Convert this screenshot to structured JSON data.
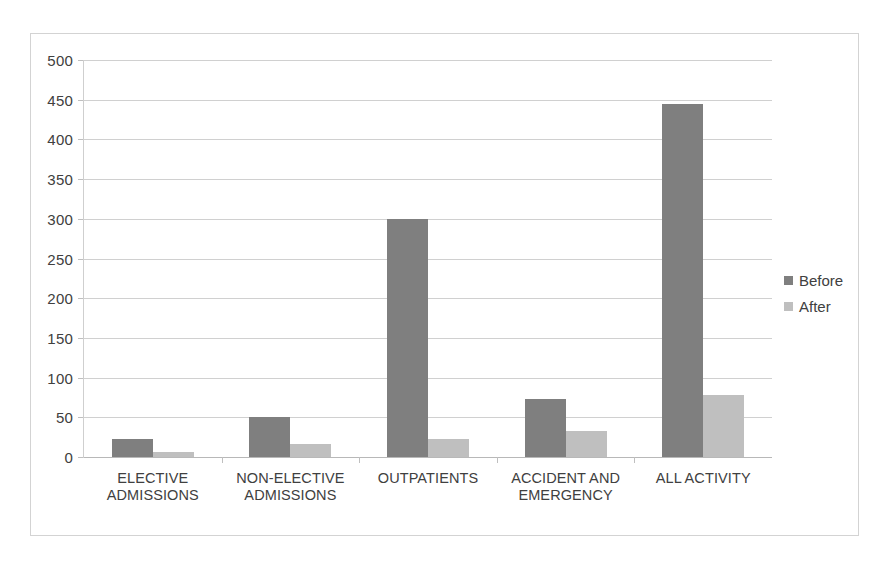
{
  "chart_data": {
    "type": "bar",
    "title": "",
    "subtitle": "",
    "xlabel": "",
    "ylabel": "",
    "ylim": [
      0,
      500
    ],
    "ytick_step": 50,
    "yticks": [
      500,
      450,
      400,
      350,
      300,
      250,
      200,
      150,
      100,
      50,
      0
    ],
    "grid": true,
    "legend_position": "right",
    "categories": [
      "ELECTIVE ADMISSIONS",
      "NON-ELECTIVE ADMISSIONS",
      "OUTPATIENTS",
      "ACCIDENT AND EMERGENCY",
      "ALL ACTIVITY"
    ],
    "category_lines": [
      [
        "ELECTIVE",
        "ADMISSIONS"
      ],
      [
        "NON-ELECTIVE",
        "ADMISSIONS"
      ],
      [
        "OUTPATIENTS",
        ""
      ],
      [
        "ACCIDENT AND",
        "EMERGENCY"
      ],
      [
        "ALL ACTIVITY",
        ""
      ]
    ],
    "series": [
      {
        "name": "Before",
        "color": "#7f7f7f",
        "values": [
          23,
          50,
          300,
          73,
          445
        ]
      },
      {
        "name": "After",
        "color": "#bfbfbf",
        "values": [
          6,
          17,
          23,
          33,
          78
        ]
      }
    ]
  },
  "legend": {
    "items": [
      {
        "label": "Before",
        "color": "#7f7f7f"
      },
      {
        "label": "After",
        "color": "#bfbfbf"
      }
    ]
  },
  "axis": {
    "y_labels": [
      "500",
      "450",
      "400",
      "350",
      "300",
      "250",
      "200",
      "150",
      "100",
      "50",
      "0"
    ]
  },
  "colors": {
    "before_bar": "#7f7f7f",
    "after_bar": "#bfbfbf",
    "gridline": "#d0d0d0",
    "frame_border": "#d3d3d3",
    "text": "#404040",
    "background": "#ffffff"
  }
}
